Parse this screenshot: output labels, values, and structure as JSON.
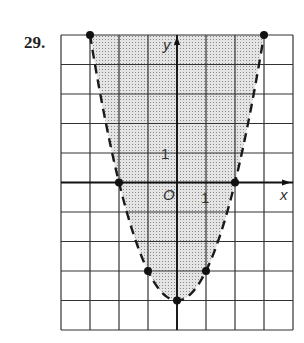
{
  "problem": {
    "number": "29."
  },
  "chart_data": {
    "type": "line",
    "title": "",
    "xlabel": "x",
    "ylabel": "y",
    "origin_label": "O",
    "tick_labels": {
      "x": "1",
      "y": "1"
    },
    "xlim": [
      -4,
      4
    ],
    "ylim": [
      -5,
      5
    ],
    "grid": true,
    "boundary": {
      "equation": "y = x^2 - 4",
      "style": "dashed"
    },
    "shading": "above-curve",
    "series": [
      {
        "name": "boundary points",
        "points": [
          {
            "x": -3,
            "y": 5
          },
          {
            "x": -2,
            "y": 0
          },
          {
            "x": -1,
            "y": -3
          },
          {
            "x": 0,
            "y": -4
          },
          {
            "x": 1,
            "y": -3
          },
          {
            "x": 2,
            "y": 0
          },
          {
            "x": 3,
            "y": 5
          }
        ]
      }
    ],
    "colors": {
      "grid": "#333333",
      "curve": "#1a1a1a",
      "shade": "#d4d4d4"
    }
  }
}
